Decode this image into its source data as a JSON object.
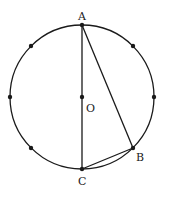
{
  "diagram": {
    "type": "circle-geometry",
    "stroke_color": "#1a1a1a",
    "points": {
      "A": {
        "label": "A",
        "role": "top of circle"
      },
      "B": {
        "label": "B",
        "role": "point on circle, lower right"
      },
      "C": {
        "label": "C",
        "role": "bottom of circle"
      },
      "O": {
        "label": "O",
        "role": "center"
      }
    },
    "segments": [
      {
        "from": "A",
        "to": "C",
        "name": "diameter-AC"
      },
      {
        "from": "A",
        "to": "B",
        "name": "chord-AB"
      },
      {
        "from": "B",
        "to": "C",
        "name": "chord-BC"
      }
    ],
    "extra_dots_on_circle": 8
  }
}
